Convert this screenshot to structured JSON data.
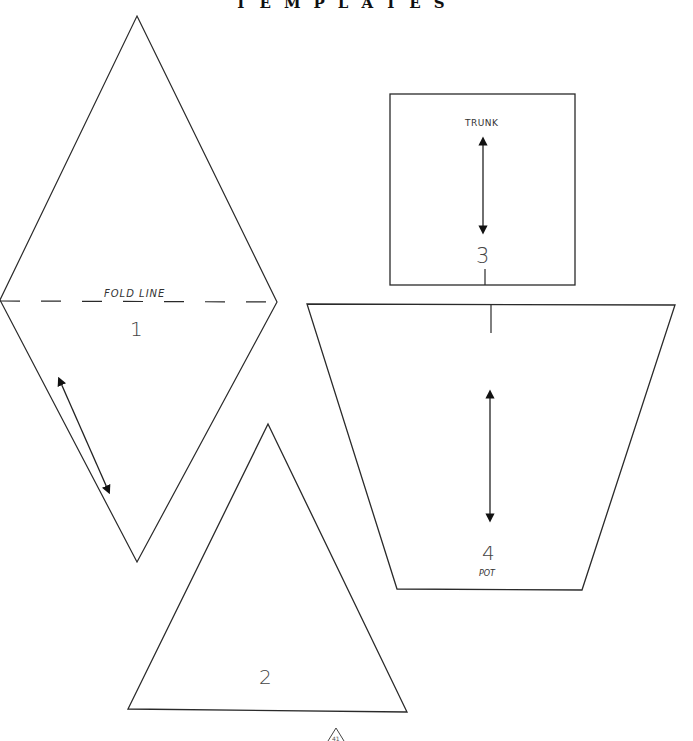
{
  "page": {
    "title": "TEMPLATES",
    "page_number": "41",
    "line_color": "#2a2a2a",
    "background": "#ffffff"
  },
  "templates": [
    {
      "id": "1",
      "number": "1",
      "shape": "diamond",
      "label": "FOLD LINE",
      "has_grain_arrow": true
    },
    {
      "id": "2",
      "number": "2",
      "shape": "triangle",
      "label": "",
      "has_grain_arrow": false
    },
    {
      "id": "3",
      "number": "3",
      "shape": "rectangle",
      "label": "TRUNK",
      "has_grain_arrow": true
    },
    {
      "id": "4",
      "number": "4",
      "shape": "trapezoid",
      "label": "POT",
      "has_grain_arrow": true
    }
  ]
}
